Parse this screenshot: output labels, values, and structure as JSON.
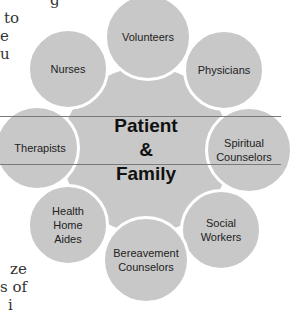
{
  "background_text": {
    "top_lines": [
      "g",
      "to",
      "e",
      "u"
    ],
    "bottom_lines": [
      "ze",
      "s of",
      "i"
    ]
  },
  "diagram": {
    "center": {
      "label": "Patient\n&\nFamily"
    },
    "nodes": [
      {
        "id": "volunteers",
        "label": "Volunteers"
      },
      {
        "id": "physicians",
        "label": "Physicians"
      },
      {
        "id": "spiritual-counselors",
        "label": "Spiritual\nCounselors"
      },
      {
        "id": "social-workers",
        "label": "Social\nWorkers"
      },
      {
        "id": "bereavement-counselors",
        "label": "Bereavement\nCounselors"
      },
      {
        "id": "health-home-aides",
        "label": "Health\nHome\nAides"
      },
      {
        "id": "therapists",
        "label": "Therapists"
      },
      {
        "id": "nurses",
        "label": "Nurses"
      }
    ],
    "colors": {
      "circle_fill": "#c8c8c8",
      "circle_border": "#ffffff",
      "line": "#7a7a7a"
    }
  }
}
